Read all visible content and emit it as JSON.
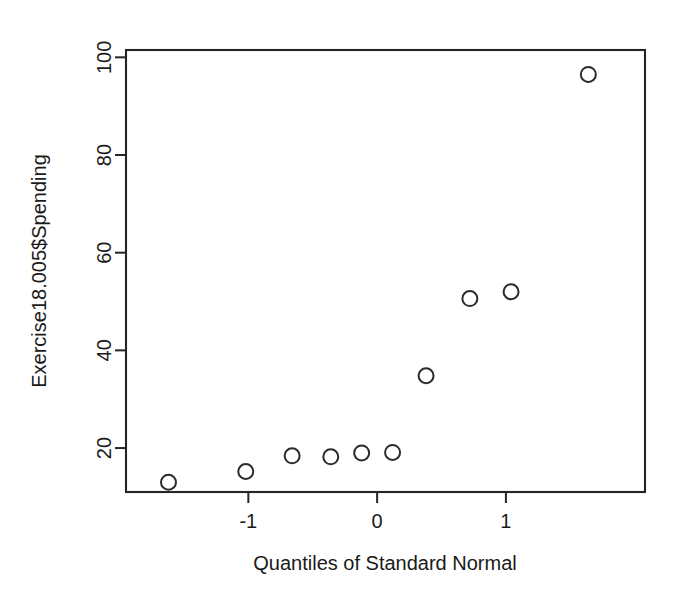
{
  "chart_data": {
    "type": "scatter",
    "title": "",
    "subtitle": "",
    "xlabel": "Quantiles of Standard Normal",
    "ylabel": "Exercise18.005$Spending",
    "xlim": [
      -1.95,
      2.08
    ],
    "ylim": [
      11.0,
      101.5
    ],
    "xticks": [
      -1,
      0,
      1
    ],
    "xtick_labels": [
      "-1",
      "0",
      "1"
    ],
    "yticks": [
      20,
      40,
      60,
      80,
      100
    ],
    "ytick_labels": [
      "20",
      "40",
      "60",
      "80",
      "100"
    ],
    "grid": false,
    "legend": null,
    "marker": "open-circle",
    "marker_color": "#2b2b2b",
    "n_points": 10,
    "x": [
      -1.62,
      -1.02,
      -0.66,
      -0.36,
      -0.12,
      0.12,
      0.38,
      0.72,
      1.04,
      1.64
    ],
    "y": [
      13.0,
      15.2,
      18.4,
      18.2,
      19.0,
      19.1,
      34.8,
      50.6,
      52.0,
      96.5
    ],
    "points": [
      {
        "x": -1.62,
        "y": 13.0
      },
      {
        "x": -1.02,
        "y": 15.2
      },
      {
        "x": -0.66,
        "y": 18.4
      },
      {
        "x": -0.36,
        "y": 18.2
      },
      {
        "x": -0.12,
        "y": 19.0
      },
      {
        "x": 0.12,
        "y": 19.1
      },
      {
        "x": 0.38,
        "y": 34.8
      },
      {
        "x": 0.72,
        "y": 50.6
      },
      {
        "x": 1.04,
        "y": 52.0
      },
      {
        "x": 1.64,
        "y": 96.5
      }
    ]
  },
  "figure": {
    "background": "#ffffff",
    "foreground": "#1a1a1a",
    "frame_color": "#252525",
    "width": 676,
    "height": 600
  }
}
